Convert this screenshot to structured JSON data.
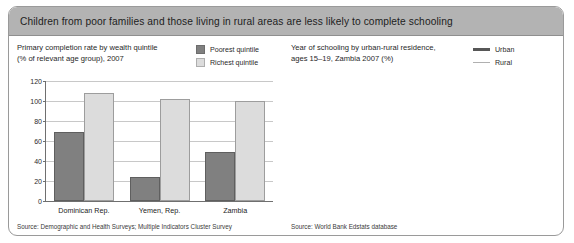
{
  "header": {
    "title": "Children from poor families and those living in rural areas are less likely to complete schooling"
  },
  "left_panel": {
    "title_line1": "Primary completion rate by wealth quintile",
    "title_line2": "(% of relevant age group), 2007",
    "legend": [
      {
        "label": "Poorest quintile",
        "color": "#808080"
      },
      {
        "label": "Richest quintile",
        "color": "#dcdcdc"
      }
    ],
    "source": "Source: Demographic and Health Surveys; Multiple Indicators Cluster Survey"
  },
  "right_panel": {
    "title_line1": "Year of schooling by urban-rural residence,",
    "title_line2": "ages 15–19, Zambia 2007 (%)",
    "legend": [
      {
        "label": "Urban",
        "color": "#575757"
      },
      {
        "label": "Rural",
        "color": "#b0b0b0"
      }
    ],
    "xaxis_title": "Years of schooling",
    "source": "Source: World Bank Edstats database"
  },
  "chart_data": [
    {
      "type": "bar",
      "title": "Primary completion rate by wealth quintile (% of relevant age group), 2007",
      "xlabel": "",
      "ylabel": "",
      "ylim": [
        0,
        120
      ],
      "yticks": [
        0,
        20,
        40,
        60,
        80,
        100,
        120
      ],
      "grid": true,
      "legend_position": "top-right",
      "categories": [
        "Dominican Rep.",
        "Yemen, Rep.",
        "Zambia"
      ],
      "series": [
        {
          "name": "Poorest quintile",
          "color": "#808080",
          "values": [
            69,
            24,
            49
          ]
        },
        {
          "name": "Richest quintile",
          "color": "#dcdcdc",
          "values": [
            108,
            102,
            100
          ]
        }
      ]
    },
    {
      "type": "line",
      "title": "Year of schooling by urban-rural residence, ages 15–19, Zambia 2007 (%)",
      "xlabel": "Years of schooling",
      "ylabel": "",
      "xlim": [
        1,
        9
      ],
      "ylim": [
        0,
        100
      ],
      "yticks": [
        0,
        20,
        40,
        60,
        80,
        100
      ],
      "xticks": [
        1,
        2,
        3,
        4,
        5,
        6,
        7,
        8,
        9
      ],
      "grid": true,
      "legend_position": "top-right",
      "x": [
        1,
        2,
        3,
        4,
        5,
        6,
        7,
        8,
        9
      ],
      "series": [
        {
          "name": "Urban",
          "color": "#575757",
          "values": [
            99,
            98.5,
            98,
            97,
            95,
            90,
            79,
            63,
            45
          ]
        },
        {
          "name": "Rural",
          "color": "#b0b0b0",
          "values": [
            94,
            91,
            86,
            75,
            60,
            45,
            33,
            21,
            10
          ]
        }
      ]
    }
  ]
}
